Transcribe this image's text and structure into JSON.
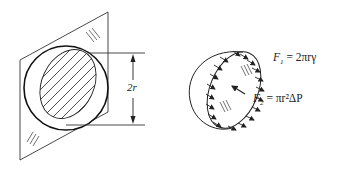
{
  "figure": {
    "left_panel": {
      "description": "Circular film with hatched region on a plane",
      "dimension_label": "2r"
    },
    "right_panel": {
      "description": "Hemispherical bubble with surface tension arrows and pressure force",
      "force_1": {
        "symbol": "F",
        "subscript": "1",
        "expression": "= 2πrγ"
      },
      "force_2": {
        "symbol": "F",
        "subscript": "2",
        "expression": "= πr²ΔP"
      }
    },
    "colors": {
      "line": "#222222",
      "background": "#ffffff"
    }
  }
}
